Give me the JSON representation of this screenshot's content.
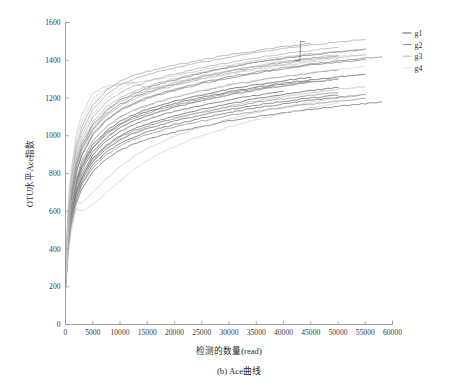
{
  "chart_data": {
    "type": "line",
    "title": "",
    "caption": "(b) Ace曲线",
    "xlabel": "检测的数量(read)",
    "ylabel": "OTU水平Ace指数",
    "xlim": [
      0,
      60000
    ],
    "ylim": [
      0,
      1600
    ],
    "xticks": [
      0,
      5000,
      10000,
      15000,
      20000,
      25000,
      30000,
      35000,
      40000,
      45000,
      50000,
      55000,
      60000
    ],
    "xtick_labels": [
      "0",
      "5000",
      "10000",
      "15000",
      "20000",
      "25000",
      "30000",
      "35000",
      "40000",
      "45000",
      "50000",
      "55000",
      "60000"
    ],
    "yticks": [
      0,
      200,
      400,
      600,
      800,
      1000,
      1200,
      1400,
      1600
    ],
    "ytick_labels": [
      "0",
      "200",
      "400",
      "600",
      "800",
      "1000",
      "1200",
      "1400",
      "1600"
    ],
    "grid": false,
    "legend_position": "top-right-outside",
    "legend": [
      {
        "label": "g1",
        "color": "#3a3a3a"
      },
      {
        "label": "g2",
        "color": "#6e6e6e"
      },
      {
        "label": "g3",
        "color": "#a8a8a8"
      },
      {
        "label": "g4",
        "color": "#d2d2d2"
      }
    ],
    "x_sample_points": [
      0,
      500,
      1000,
      2000,
      3000,
      5000,
      7500,
      10000,
      12500,
      15000,
      17500,
      20000,
      25000,
      30000,
      35000,
      40000,
      45000,
      50000,
      55000,
      58000
    ],
    "series": [
      {
        "name": "g1-s1",
        "group": "g1",
        "color": "#3f3f3f",
        "values": [
          210,
          430,
          560,
          700,
          780,
          880,
          950,
          1000,
          1035,
          1062,
          1085,
          1105,
          1140,
          1170,
          1196,
          1218,
          1238,
          1256,
          null,
          null
        ]
      },
      {
        "name": "g1-s2",
        "group": "g1",
        "color": "#454545",
        "values": [
          225,
          455,
          590,
          735,
          815,
          915,
          990,
          1042,
          1078,
          1106,
          1130,
          1150,
          1186,
          1216,
          1242,
          1264,
          1284,
          1300,
          null,
          null
        ]
      },
      {
        "name": "g1-s3",
        "group": "g1",
        "color": "#4a4a4a",
        "values": [
          200,
          410,
          535,
          672,
          748,
          845,
          912,
          960,
          994,
          1020,
          1042,
          1060,
          1094,
          1122,
          1148,
          1168,
          1188,
          1204,
          1218,
          null
        ]
      },
      {
        "name": "g1-s4",
        "group": "g1",
        "color": "#383838",
        "values": [
          240,
          480,
          620,
          770,
          852,
          952,
          1026,
          1076,
          1112,
          1140,
          1162,
          1182,
          1216,
          1246,
          1270,
          1292,
          1310,
          null,
          null,
          null
        ]
      },
      {
        "name": "g1-s5",
        "group": "g1",
        "color": "#505050",
        "values": [
          190,
          395,
          515,
          645,
          718,
          812,
          876,
          922,
          955,
          980,
          1001,
          1018,
          1050,
          1078,
          1101,
          1122,
          1140,
          1156,
          1170,
          1180
        ]
      },
      {
        "name": "g1-s6",
        "group": "g1",
        "color": "#424242",
        "values": [
          215,
          440,
          575,
          715,
          796,
          898,
          972,
          1022,
          1058,
          1086,
          1108,
          1128,
          1162,
          1190,
          1214,
          1236,
          null,
          null,
          null,
          null
        ]
      },
      {
        "name": "g1-s7",
        "group": "g1",
        "color": "#4e4e4e",
        "values": [
          205,
          420,
          548,
          688,
          765,
          862,
          930,
          978,
          1012,
          1038,
          1060,
          1078,
          1110,
          1138,
          1162,
          1182,
          1200,
          1215,
          null,
          null
        ]
      },
      {
        "name": "g1-s8",
        "group": "g1",
        "color": "#3d3d3d",
        "values": [
          232,
          470,
          608,
          756,
          838,
          940,
          1014,
          1064,
          1100,
          1128,
          1150,
          1170,
          1204,
          1232,
          1256,
          1278,
          1296,
          1312,
          1326,
          null
        ]
      },
      {
        "name": "g2-s1",
        "group": "g2",
        "color": "#6b6b6b",
        "values": [
          245,
          500,
          648,
          808,
          896,
          1002,
          1080,
          1132,
          1168,
          1196,
          1220,
          1240,
          1276,
          1306,
          1332,
          1354,
          1374,
          1390,
          1404,
          null
        ]
      },
      {
        "name": "g2-s2",
        "group": "g2",
        "color": "#727272",
        "values": [
          228,
          462,
          600,
          748,
          830,
          932,
          1006,
          1056,
          1092,
          1120,
          1142,
          1162,
          1196,
          1226,
          1250,
          1272,
          1290,
          null,
          null,
          null
        ]
      },
      {
        "name": "g2-s3",
        "group": "g2",
        "color": "#656565",
        "values": [
          255,
          520,
          672,
          838,
          928,
          1036,
          1114,
          1166,
          1202,
          1230,
          1254,
          1274,
          1310,
          1340,
          1366,
          1388,
          1408,
          1424,
          null,
          null
        ]
      },
      {
        "name": "g2-s4",
        "group": "g2",
        "color": "#767676",
        "values": [
          198,
          405,
          528,
          660,
          735,
          832,
          898,
          946,
          980,
          1006,
          1028,
          1046,
          1078,
          1106,
          1130,
          1150,
          1168,
          1184,
          1198,
          null
        ]
      },
      {
        "name": "g2-s5",
        "group": "g2",
        "color": "#6e6e6e",
        "values": [
          238,
          485,
          628,
          782,
          868,
          972,
          1048,
          1098,
          1134,
          1162,
          1184,
          1204,
          1238,
          1268,
          1292,
          1314,
          1332,
          1348,
          null,
          null
        ]
      },
      {
        "name": "g2-s6",
        "group": "g2",
        "color": "#5f5f5f",
        "values": [
          262,
          532,
          688,
          856,
          948,
          1058,
          1136,
          1188,
          1224,
          1252,
          1276,
          1296,
          1332,
          1362,
          1388,
          1410,
          1428,
          1444,
          1458,
          null
        ]
      },
      {
        "name": "g2-s7",
        "group": "g2",
        "color": "#7a7a7a",
        "values": [
          210,
          428,
          558,
          698,
          776,
          876,
          944,
          992,
          1026,
          1052,
          1074,
          1092,
          1124,
          1152,
          1176,
          1196,
          1214,
          1228,
          null,
          null
        ]
      },
      {
        "name": "g2-s8",
        "group": "g2",
        "color": "#696969",
        "values": [
          248,
          505,
          652,
          812,
          900,
          1008,
          1086,
          1138,
          1174,
          1202,
          1226,
          1246,
          1282,
          1312,
          1338,
          1360,
          1380,
          1396,
          1410,
          1418
        ]
      },
      {
        "name": "g3-s1",
        "group": "g3",
        "color": "#9f9f9f",
        "values": [
          270,
          552,
          712,
          888,
          982,
          1096,
          1176,
          1228,
          1262,
          1288,
          1310,
          1328,
          1360,
          1388,
          1412,
          1434,
          1452,
          1468,
          null,
          null
        ]
      },
      {
        "name": "g3-s2",
        "group": "g3",
        "color": "#a8a8a8",
        "values": [
          252,
          515,
          666,
          830,
          920,
          1028,
          1106,
          1158,
          1194,
          1222,
          1246,
          1266,
          1302,
          1332,
          1358,
          1380,
          1398,
          1414,
          1428,
          null
        ]
      },
      {
        "name": "g3-s3",
        "group": "g3",
        "color": "#989898",
        "values": [
          282,
          575,
          742,
          925,
          1022,
          1140,
          1218,
          1268,
          1300,
          1324,
          1344,
          1360,
          1390,
          1416,
          1440,
          1462,
          1480,
          1496,
          1510,
          null
        ]
      },
      {
        "name": "g3-s4",
        "group": "g3",
        "color": "#b0b0b0",
        "values": [
          222,
          452,
          588,
          734,
          816,
          918,
          992,
          1042,
          1078,
          1106,
          1130,
          1150,
          1186,
          1216,
          1242,
          1264,
          1284,
          1300,
          null,
          null
        ]
      },
      {
        "name": "g3-s5",
        "group": "g3",
        "color": "#a2a2a2",
        "values": [
          265,
          540,
          698,
          870,
          962,
          1074,
          1152,
          1202,
          1236,
          1262,
          1284,
          1302,
          1336,
          1364,
          1390,
          1412,
          1430,
          1446,
          1460,
          null
        ]
      },
      {
        "name": "g3-s6",
        "group": "g3",
        "color": "#949494",
        "values": [
          290,
          592,
          762,
          948,
          1046,
          1164,
          1240,
          1288,
          1318,
          1340,
          1358,
          1374,
          1402,
          1428,
          1450,
          1472,
          1490,
          null,
          null,
          null
        ]
      },
      {
        "name": "g3-s7",
        "group": "g3",
        "color": "#aeaeae",
        "values": [
          206,
          420,
          548,
          686,
          764,
          862,
          932,
          982,
          1018,
          1046,
          1070,
          1090,
          1126,
          1158,
          1184,
          1208,
          1228,
          1246,
          1260,
          null
        ]
      },
      {
        "name": "g3-s8",
        "group": "g3",
        "color": "#a5a5a5",
        "values": [
          258,
          526,
          680,
          848,
          938,
          1048,
          1126,
          1178,
          1212,
          1240,
          1262,
          1282,
          1316,
          1346,
          1372,
          1394,
          1412,
          1428,
          null,
          null
        ]
      },
      {
        "name": "g4-s1",
        "group": "g4",
        "color": "#c4c4c4",
        "values": [
          300,
          612,
          788,
          978,
          1078,
          1196,
          1248,
          1270,
          1282,
          1248,
          1258,
          1272,
          1300,
          1326,
          1350,
          1372,
          1390,
          1406,
          null,
          null
        ]
      },
      {
        "name": "g4-s2",
        "group": "g4",
        "color": "#cccccc",
        "values": [
          276,
          562,
          726,
          904,
          1000,
          1116,
          1196,
          1248,
          1282,
          1248,
          1262,
          1280,
          1312,
          1342,
          1366,
          1388,
          1406,
          1420,
          1432,
          null
        ]
      },
      {
        "name": "g4-s3",
        "group": "g4",
        "color": "#bdbdbd",
        "values": [
          310,
          632,
          812,
          1008,
          1110,
          1228,
          1262,
          1276,
          1284,
          1292,
          1304,
          1318,
          1348,
          1374,
          1398,
          1418,
          1436,
          null,
          null,
          null
        ]
      },
      {
        "name": "g4-s4",
        "group": "g4",
        "color": "#d4d4d4",
        "values": [
          236,
          482,
          624,
          778,
          862,
          968,
          1044,
          1094,
          1130,
          1158,
          1182,
          1202,
          1238,
          1268,
          1294,
          1316,
          1336,
          1352,
          1366,
          null
        ]
      },
      {
        "name": "g4-s5",
        "group": "g4",
        "color": "#c8c8c8",
        "values": [
          180,
          372,
          488,
          612,
          600,
          638,
          700,
          760,
          820,
          868,
          908,
          942,
          1000,
          1046,
          1084,
          1118,
          1148,
          1174,
          null,
          null
        ]
      },
      {
        "name": "g4-s6",
        "group": "g4",
        "color": "#bfbfbf",
        "values": [
          192,
          396,
          518,
          648,
          640,
          700,
          772,
          836,
          888,
          930,
          966,
          996,
          1046,
          1088,
          1122,
          1152,
          1178,
          1200,
          1218,
          null
        ]
      }
    ],
    "annotations": [
      {
        "text": "spike near x=43000 rising to ~1500",
        "x": 43000,
        "y": 1500
      }
    ]
  }
}
